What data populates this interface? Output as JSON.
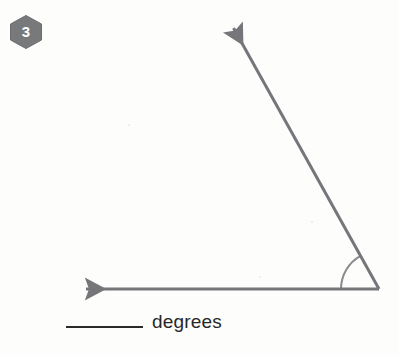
{
  "page": {
    "background_color": "#fdfdfc",
    "width": 398,
    "height": 355
  },
  "problem": {
    "number": "3",
    "badge_shape": "hexagon",
    "badge_color": "#78797b",
    "badge_text_color": "#ffffff"
  },
  "figure": {
    "name": "angle-diagram",
    "stroke_color": "#76767a",
    "stroke_width": 3,
    "vertex": {
      "x": 379,
      "y": 289
    },
    "rays": [
      {
        "name": "horizontal-ray",
        "direction": "left",
        "tip": {
          "x": 78,
          "y": 289
        },
        "arrowhead": true
      },
      {
        "name": "diagonal-ray",
        "direction": "up-left",
        "tip": {
          "x": 229,
          "y": 20
        },
        "arrowhead": true
      }
    ],
    "angle_arc": {
      "name": "angle-arc",
      "radius": 38,
      "start_degrees": 180,
      "end_degrees": 119
    }
  },
  "answer": {
    "blank_label": "",
    "unit_label": "degrees",
    "text_color": "#27272a"
  }
}
